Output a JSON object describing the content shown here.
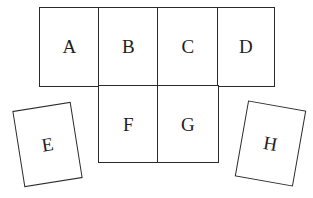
{
  "diagram": {
    "type": "box-net",
    "stroke_color": "#2a2a2a",
    "text_color": "#1e1e1e",
    "background": "#ffffff",
    "panels": [
      {
        "id": "A",
        "label": "A"
      },
      {
        "id": "B",
        "label": "B"
      },
      {
        "id": "C",
        "label": "C"
      },
      {
        "id": "D",
        "label": "D"
      },
      {
        "id": "E",
        "label": "E"
      },
      {
        "id": "F",
        "label": "F"
      },
      {
        "id": "G",
        "label": "G"
      },
      {
        "id": "H",
        "label": "H"
      }
    ]
  }
}
